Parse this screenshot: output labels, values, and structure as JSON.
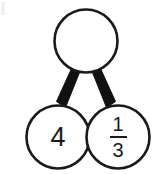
{
  "figure": {
    "stroke_color": "#1a1a1a",
    "fill_color": "#ffffff",
    "background_color": "#ffffff",
    "connector_color": "#111111"
  },
  "nodes": {
    "total": {
      "name": "total",
      "value": "",
      "filled": false,
      "cx": 86,
      "cy": 41,
      "r": 31.5
    },
    "part_left": {
      "name": "part-left",
      "value": "4",
      "filled": true,
      "cx": 58,
      "cy": 137,
      "r": 31.5
    },
    "part_right": {
      "name": "part-right",
      "value": "1/3",
      "numerator": "1",
      "denominator": "3",
      "filled": true,
      "cx": 118,
      "cy": 137,
      "r": 31.5
    }
  },
  "connectors": [
    {
      "name": "connector-total-to-left",
      "from": "total",
      "to": "part_left"
    },
    {
      "name": "connector-total-to-right",
      "from": "total",
      "to": "part_right"
    }
  ]
}
